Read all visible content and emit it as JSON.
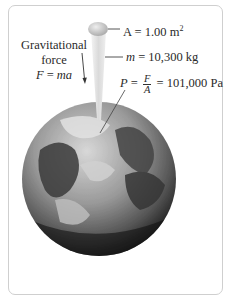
{
  "figure": {
    "area_label": {
      "symbol": "A",
      "eq": " = ",
      "value": "1.00 m",
      "exp": "2"
    },
    "mass_label": {
      "symbol": "m",
      "eq": " = ",
      "value": "10,300 kg"
    },
    "pressure_label": {
      "symbol": "P",
      "eq1": " = ",
      "num": "F",
      "den": "A",
      "eq2": " = ",
      "value": "101,000 Pa"
    },
    "force_label": {
      "line1": "Gravitational",
      "line2": "force",
      "formula_lhs": "F",
      "formula_eq": " = ",
      "formula_rhs": "ma"
    },
    "colors": {
      "frame_border": "#cfcfcf",
      "leader_line": "#555555",
      "earth_dark": "#1a1a1a",
      "earth_light": "#cfcfcf",
      "column": "#e6e6e6"
    }
  }
}
